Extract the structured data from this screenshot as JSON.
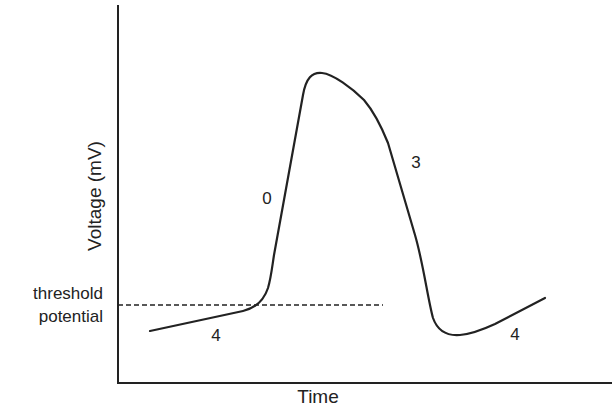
{
  "diagram": {
    "title": "",
    "y_axis_label": "Voltage (mV)",
    "x_axis_label": "Time",
    "threshold_label_line1": "threshold",
    "threshold_label_line2": "potential",
    "phase_labels": {
      "phase4_left": "4",
      "phase0": "0",
      "phase3": "3",
      "phase4_right": "4"
    },
    "colors": {
      "line": "#222222",
      "background": "#ffffff"
    }
  }
}
